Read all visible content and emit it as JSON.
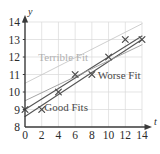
{
  "chart_data": {
    "type": "scatter",
    "title": "",
    "subtitle": "",
    "xlabel": "t",
    "ylabel": "y",
    "xlim": [
      0,
      14
    ],
    "ylim": [
      8,
      14
    ],
    "grid": true,
    "legend_position": "inline-annotations",
    "xticks": [
      "0",
      "2",
      "4",
      "6",
      "8",
      "10",
      "12",
      "14"
    ],
    "xtick_values": [
      0,
      2,
      4,
      6,
      8,
      10,
      12,
      14
    ],
    "yticks": [
      "8",
      "9",
      "10",
      "11",
      "12",
      "13",
      "14"
    ],
    "ytick_values": [
      8,
      9,
      10,
      11,
      12,
      13,
      14
    ],
    "points": [
      {
        "x": 0,
        "y": 9
      },
      {
        "x": 2,
        "y": 9
      },
      {
        "x": 4,
        "y": 10
      },
      {
        "x": 6,
        "y": 11
      },
      {
        "x": 8,
        "y": 11
      },
      {
        "x": 10,
        "y": 12
      },
      {
        "x": 12,
        "y": 13
      },
      {
        "x": 14,
        "y": 13
      }
    ],
    "point_marker": "x",
    "series": [
      {
        "name": "Good Fits",
        "kind": "line",
        "role": "good-fit-upper",
        "x": [
          0,
          14
        ],
        "values": [
          9.0,
          13.2
        ],
        "color": "#555555"
      },
      {
        "name": "Good Fits",
        "kind": "line",
        "role": "good-fit-lower",
        "x": [
          0,
          14
        ],
        "values": [
          8.6,
          13.0
        ],
        "color": "#555555"
      },
      {
        "name": "Worse Fit",
        "kind": "line",
        "role": "worse-fit",
        "x": [
          0,
          14
        ],
        "values": [
          9.5,
          12.7
        ],
        "color": "#9a9a9a"
      },
      {
        "name": "Terrible Fit",
        "kind": "line",
        "role": "terrible-fit",
        "x": [
          0,
          14
        ],
        "values": [
          10.5,
          13.9
        ],
        "color": "#c8c8c8"
      }
    ],
    "annotations": [
      {
        "text": "Terrible Fit",
        "x": 1.6,
        "y": 11.95,
        "style": "faint"
      },
      {
        "text": "Worse Fit",
        "x": 8.7,
        "y": 10.95,
        "style": "normal"
      },
      {
        "text": "Good Fits",
        "x": 2.3,
        "y": 9.1,
        "style": "normal"
      }
    ],
    "colors": {
      "axis": "#3a3a3a",
      "grid": "#d8d8d8",
      "marker": "#4a4a4a",
      "good_fit": "#555555",
      "worse_fit": "#9a9a9a",
      "terrible_fit": "#c8c8c8",
      "background": "#ffffff"
    }
  }
}
